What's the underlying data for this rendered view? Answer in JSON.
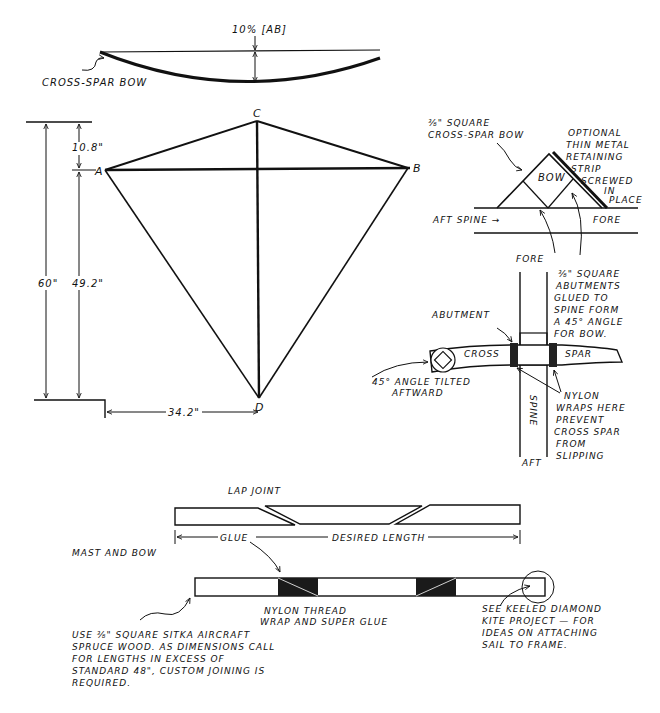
{
  "bow_diagram": {
    "top_label": "10% [AB]",
    "name_label": "CROSS-SPAR BOW"
  },
  "kite_outline": {
    "vertices": {
      "A": "A",
      "B": "B",
      "C": "C",
      "D": "D"
    },
    "dim_total": "60\"",
    "dim_top": "10.8\"",
    "dim_lower": "49.2\"",
    "dim_half_width": "34.2\""
  },
  "bow_joint": {
    "bow_label_line1": "⅜\" SQUARE",
    "bow_label_line2": "CROSS-SPAR BOW",
    "strip_label": [
      "OPTIONAL",
      "THIN METAL",
      "RETAINING",
      "STRIP",
      "SCREWED",
      "IN",
      "PLACE"
    ],
    "bow_text": "BOW",
    "aft_spine": "AFT SPINE →",
    "fore": "FORE"
  },
  "cross_detail": {
    "fore": "FORE",
    "aft": "AFT",
    "spine": "SPINE",
    "abutment": "ABUTMENT",
    "cross": "CROSS",
    "spar": "SPAR",
    "abutment_note": [
      "⅜\" SQUARE",
      "ABUTMENTS",
      "GLUED TO",
      "SPINE FORM",
      "A 45° ANGLE",
      "FOR BOW."
    ],
    "angle_note": [
      "45° ANGLE TILTED",
      "AFTWARD"
    ],
    "nylon_note": [
      "NYLON",
      "WRAPS HERE",
      "PREVENT",
      "CROSS SPAR",
      "FROM",
      "SLIPPING"
    ]
  },
  "lap_joint": {
    "title": "LAP JOINT",
    "glue": "GLUE",
    "desired_length": "DESIRED LENGTH"
  },
  "mast": {
    "title": "MAST AND BOW",
    "thread_note": [
      "NYLON THREAD",
      "WRAP AND SUPER GLUE"
    ],
    "wood_note": [
      "USE ⅜\" SQUARE SITKA AIRCRAFT",
      "SPRUCE WOOD. AS DIMENSIONS CALL",
      "FOR LENGTHS IN EXCESS OF",
      "STANDARD 48\", CUSTOM JOINING IS",
      "REQUIRED."
    ],
    "keeled_note": [
      "SEE KEELED DIAMOND",
      "KITE PROJECT — FOR",
      "IDEAS ON ATTACHING",
      "SAIL TO FRAME."
    ]
  }
}
